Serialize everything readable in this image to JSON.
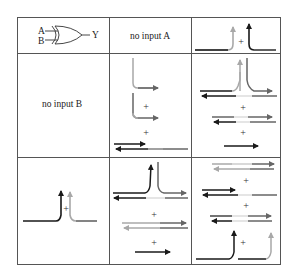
{
  "diagram": {
    "type": "xor-gate-truth-table-illustration",
    "gate": {
      "symbol": "XOR",
      "inputs": [
        "A",
        "B"
      ],
      "output": "Y"
    },
    "header_row": {
      "col_a_label": "no input A"
    },
    "row_b": {
      "row_label": "no input B"
    },
    "plus_sign": "+",
    "colors": {
      "border": "#555555",
      "dark_arrow": "#1a1a1a",
      "mid_arrow": "#666666",
      "light_arrow": "#a8a8a8",
      "background": "#ffffff"
    },
    "cells": [
      {
        "row": 0,
        "col": 0,
        "content": "XOR gate symbol A, B -> Y"
      },
      {
        "row": 0,
        "col": 1,
        "content": "no input A"
      },
      {
        "row": 0,
        "col": 2,
        "content": "two upward output arrows (light, dark) merging from horizontal lines with +"
      },
      {
        "row": 1,
        "col": 0,
        "content": "no input B"
      },
      {
        "row": 1,
        "col": 1,
        "content": "two bend-right arrows with + ; bidirectional arrows at bottom"
      },
      {
        "row": 1,
        "col": 2,
        "content": "Y-junction upward arrow over bidirectional pairs, + , bidirectional pair, + , right arrow"
      },
      {
        "row": 2,
        "col": 0,
        "content": "dark and light upward arrows with + from horizontal lines"
      },
      {
        "row": 2,
        "col": 1,
        "content": "Y-junction upward arrow, + , bidirectional pair, + , right arrow"
      },
      {
        "row": 2,
        "col": 2,
        "content": "stacked bidirectional pairs with + ; bottom two upward arrows with +"
      }
    ]
  }
}
